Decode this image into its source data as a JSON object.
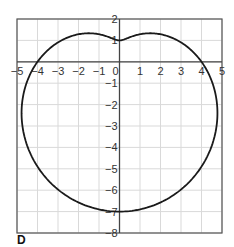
{
  "panel_label": "D",
  "chart_data": {
    "type": "line",
    "title": "",
    "equation_polar": {
      "a": 4,
      "b": -3,
      "trig": "sin"
    },
    "xlabel": "",
    "ylabel": "",
    "xlim": [
      -5,
      5
    ],
    "ylim": [
      -8,
      2
    ],
    "grid": true,
    "x_ticks": [
      -5,
      -4,
      -3,
      -2,
      -1,
      0,
      1,
      2,
      3,
      4,
      5
    ],
    "x_tick_labels": [
      "−5",
      "−4",
      "−3",
      "−2",
      "−1",
      "0",
      "1",
      "2",
      "3",
      "4",
      "5"
    ],
    "y_ticks": [
      2,
      1,
      -1,
      -2,
      -3,
      -4,
      -5,
      -6,
      -7,
      -8
    ],
    "y_tick_labels": [
      "2",
      "1",
      "−1",
      "−2",
      "−3",
      "−4",
      "−5",
      "−6",
      "−7",
      "−8"
    ],
    "key_points": [
      {
        "x": 0,
        "y": 1,
        "note": "dimple on top (theta=90°)"
      },
      {
        "x": 4,
        "y": 0,
        "note": "x-intercept"
      },
      {
        "x": -4,
        "y": 0,
        "note": "x-intercept"
      },
      {
        "x": 0,
        "y": -7,
        "note": "bottom (theta=270°)"
      },
      {
        "x": 1.6,
        "y": 1.35,
        "note": "local max right"
      },
      {
        "x": -1.6,
        "y": 1.35,
        "note": "local max left"
      }
    ],
    "legend": []
  },
  "colors": {
    "curve": "#1a1a1a",
    "grid": "#d9d9d9",
    "axis": "#444444"
  }
}
